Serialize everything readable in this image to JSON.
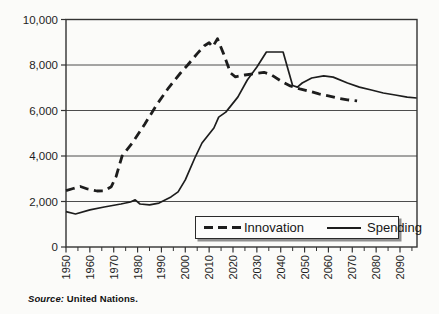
{
  "figure": {
    "source_prefix": "Source:",
    "source_text": " United Nations."
  },
  "colors": {
    "ink": "#1d1d1d",
    "gridline": "#4d4d4d",
    "plot_border": "#333333",
    "legend_shadow": "#8f8f8f"
  },
  "chart_data": {
    "type": "line",
    "title": "",
    "xlabel": "",
    "ylabel": "",
    "x_range": [
      1950,
      2097
    ],
    "ylim": [
      0,
      10000
    ],
    "grid": "horizontal",
    "legend_position": "inside-bottom-center",
    "y_ticks": [
      0,
      2000,
      4000,
      6000,
      8000,
      10000
    ],
    "y_tick_labels": [
      "0",
      "2,000",
      "4,000",
      "6,000",
      "8,000",
      "10,000"
    ],
    "x_tick_labels": [
      "1950",
      "1960",
      "1970",
      "1980",
      "1990",
      "2000",
      "2010",
      "2020",
      "2030",
      "2040",
      "2050",
      "2060",
      "2070",
      "2080",
      "2090"
    ],
    "x_ticks_major": [
      1950,
      1960,
      1970,
      1980,
      1990,
      2000,
      2010,
      2020,
      2030,
      2040,
      2050,
      2060,
      2070,
      2080,
      2090
    ],
    "x_ticks_minor": [
      1955,
      1965,
      1975,
      1985,
      1995,
      2005,
      2015,
      2025,
      2035,
      2045,
      2055,
      2065,
      2075,
      2085,
      2095
    ],
    "series": [
      {
        "name": "Innovation",
        "style": "dashed",
        "x": [
          1950,
          1953,
          1956,
          1959,
          1963,
          1966,
          1969,
          1971,
          1973.5,
          1978,
          1983,
          1988,
          1993,
          1998,
          2001,
          2005,
          2008,
          2010,
          2011.5,
          2013.5,
          2016,
          2019,
          2021,
          2025,
          2029,
          2033,
          2036,
          2040,
          2044,
          2048,
          2052,
          2056,
          2060,
          2064,
          2068,
          2072
        ],
        "y": [
          2480,
          2570,
          2660,
          2550,
          2460,
          2470,
          2650,
          3100,
          4000,
          4600,
          5400,
          6250,
          7000,
          7650,
          8000,
          8500,
          8850,
          8980,
          8800,
          9150,
          8500,
          7650,
          7480,
          7560,
          7620,
          7680,
          7570,
          7300,
          7080,
          6950,
          6850,
          6730,
          6640,
          6540,
          6470,
          6420
        ]
      },
      {
        "name": "Spending",
        "style": "solid",
        "x": [
          1950,
          1954,
          1960,
          1966,
          1973,
          1977,
          1979,
          1981,
          1985,
          1989,
          1994,
          1997,
          2000,
          2004,
          2007,
          2012,
          2014,
          2017,
          2022,
          2026,
          2030,
          2034,
          2041,
          2045,
          2047,
          2049,
          2053,
          2058,
          2062,
          2068,
          2073,
          2078,
          2083,
          2088,
          2093,
          2097
        ],
        "y": [
          1550,
          1450,
          1630,
          1760,
          1890,
          1980,
          2070,
          1890,
          1850,
          1930,
          2200,
          2420,
          2950,
          3910,
          4570,
          5230,
          5710,
          5930,
          6590,
          7340,
          7910,
          8570,
          8570,
          7100,
          7030,
          7210,
          7430,
          7520,
          7470,
          7210,
          7030,
          6900,
          6770,
          6680,
          6590,
          6550
        ]
      }
    ]
  }
}
